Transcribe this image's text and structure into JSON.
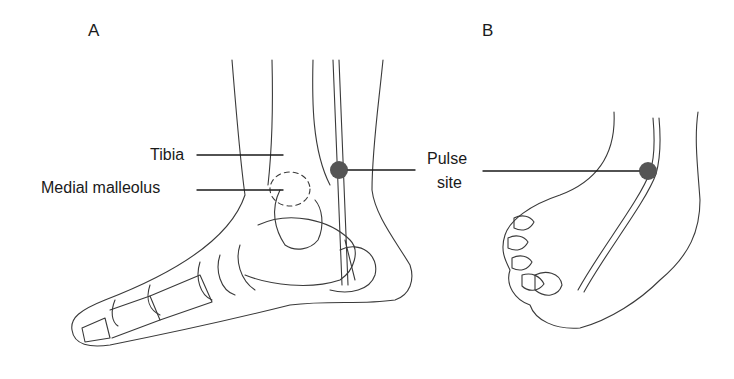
{
  "figure": {
    "panels": [
      {
        "label": "A",
        "view": "medial side of foot and ankle (bones shown)"
      },
      {
        "label": "B",
        "view": "dorsum of foot"
      }
    ],
    "labels": {
      "tibia": "Tibia",
      "medial_malleolus": "Medial malleolus",
      "pulse_line1": "Pulse",
      "pulse_line2": "site"
    },
    "colors": {
      "line": "#3a3a3a",
      "pulse_dot": "#555555",
      "text": "#1a1a1a",
      "background": "#ffffff"
    }
  }
}
